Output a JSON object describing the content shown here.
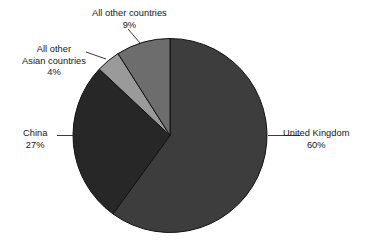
{
  "chart_data": {
    "type": "pie",
    "title": "",
    "subtitle": "",
    "xlabel": "",
    "ylabel": "",
    "legend_position": "none",
    "grid": false,
    "value_unit": "percent",
    "start_angle_deg": 0,
    "direction": "clockwise",
    "categories": [
      "United Kingdom",
      "China",
      "All other Asian countries",
      "All other countries"
    ],
    "values": [
      60,
      27,
      4,
      9
    ],
    "slices": [
      {
        "label": "United Kingdom",
        "label_lines": [
          "United Kingdom"
        ],
        "value": 60,
        "value_label": "60%",
        "color": "#3d3d3d"
      },
      {
        "label": "China",
        "label_lines": [
          "China"
        ],
        "value": 27,
        "value_label": "27%",
        "color": "#272727"
      },
      {
        "label": "All other Asian countries",
        "label_lines": [
          "All other",
          "Asian countries"
        ],
        "value": 4,
        "value_label": "4%",
        "color": "#9a9a9a"
      },
      {
        "label": "All other countries",
        "label_lines": [
          "All other countries"
        ],
        "value": 9,
        "value_label": "9%",
        "color": "#6d6d6d"
      }
    ]
  },
  "labels": {
    "uk": {
      "line1": "United Kingdom",
      "percent": "60%"
    },
    "china": {
      "line1": "China",
      "percent": "27%"
    },
    "asia": {
      "line1": "All other",
      "line2": "Asian countries",
      "percent": "4%"
    },
    "other": {
      "line1": "All other countries",
      "percent": "9%"
    }
  },
  "style": {
    "background": "#ffffff",
    "text_color": "#161616",
    "leader_line_color": "#3a3a3a",
    "slice_outline": "#111111"
  }
}
